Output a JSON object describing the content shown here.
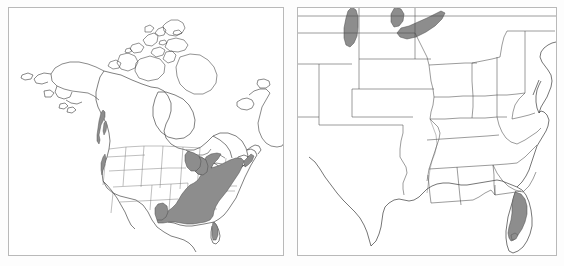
{
  "figure": {
    "background_color": "#fdfdfd",
    "panel_border_color": "#b9b9b9",
    "outline_color": "#3b3b3b",
    "shade_color": "#8d8d8d",
    "shade_stroke_color": "#4a4a4a",
    "panel_count": 2
  },
  "panels": [
    {
      "id": "panel-left",
      "name": "north-america-range-map",
      "extent_label": "North America",
      "frame": {
        "x": 8,
        "y": 7,
        "width": 276,
        "height": 249
      },
      "features": [
        "Alaska",
        "Canada mainland",
        "Canadian Arctic Archipelago",
        "Greenland west coast",
        "Hudson Bay",
        "Great Lakes",
        "Contiguous United States",
        "Northern Mexico",
        "Gulf of Mexico",
        "Baja California",
        "Florida peninsula",
        "Newfoundland",
        "Labrador"
      ],
      "shaded_regions": [
        "Pacific Northwest coastal strip",
        "Lower Michigan",
        "Ohio Valley",
        "Appalachians",
        "Mid-Atlantic coast",
        "Southeastern United States",
        "Gulf Coastal Plain",
        "East Texas"
      ],
      "shade_description": "Dark gray shading over the eastern and southeastern United States with a small isolated strip on the Pacific Northwest coast"
    },
    {
      "id": "panel-right",
      "name": "eastern-united-states-range-map",
      "extent_label": "Eastern United States",
      "frame": {
        "x": 297,
        "y": 7,
        "width": 260,
        "height": 249
      },
      "features": [
        "State boundaries",
        "Great Lakes",
        "Gulf Coast",
        "Atlantic Coast",
        "Florida peninsula",
        "Chesapeake Bay",
        "Mississippi River",
        "Texas"
      ],
      "shaded_regions": [
        "Lake Michigan",
        "Lake Huron",
        "Lake Erie",
        "Florida peninsula interior"
      ],
      "shade_description": "Gray shading over Lake Michigan, Lake Huron, Lake Erie and the interior of the Florida peninsula"
    }
  ],
  "legend": {
    "present": false,
    "shade_meaning": "Shaded area indicates distribution / occurrence range"
  }
}
